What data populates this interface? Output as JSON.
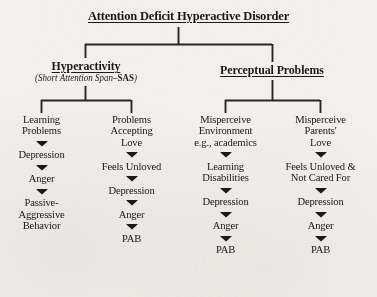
{
  "diagram": {
    "title": "Attention Deficit Hyperactive Disorder",
    "branches": [
      {
        "heading": "Hyperactivity",
        "subtitle_prefix": "(Short Attention Span–",
        "subtitle_bold": "SAS",
        "subtitle_suffix": ")"
      },
      {
        "heading": "Perceptual Problems"
      }
    ],
    "columns": [
      {
        "name": "learning-problems",
        "steps": [
          "Learning\nProblems",
          "Depression",
          "Anger",
          "Passive-\nAggressive\nBehavior"
        ]
      },
      {
        "name": "problems-accepting-love",
        "steps": [
          "Problems\nAccepting\nLove",
          "Feels Unloved",
          "Depression",
          "Anger",
          "PAB"
        ]
      },
      {
        "name": "misperceive-environment",
        "steps": [
          "Misperceive\nEnvironment\ne.g., academics",
          "Learning\nDisabilities",
          "Depression",
          "Anger",
          "PAB"
        ]
      },
      {
        "name": "misperceive-parents-love",
        "steps": [
          "Misperceive\nParents'\nLove",
          "Feels Unloved &\nNot Cared For",
          "Depression",
          "Anger",
          "PAB"
        ]
      }
    ],
    "arrow_glyph": "down-wedge",
    "colors": {
      "ink": "#1d1a16",
      "paper": "#f2f0ea",
      "line": "#2a2622"
    }
  }
}
